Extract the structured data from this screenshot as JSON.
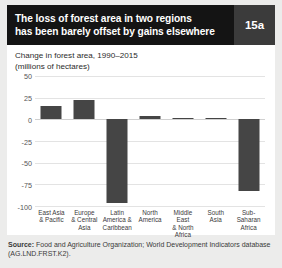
{
  "header": {
    "title_line1": "The loss of forest area in two regions",
    "title_line2": "has been barely offset by gains elsewhere",
    "badge": "15a"
  },
  "source": {
    "label": "Source:",
    "text": " Food and Agriculture Organization; World Development Indicators database (AG.LND.FRST.K2)."
  },
  "colors": {
    "header_bg": "#141414",
    "badge_bg": "#3b3b3b",
    "bar": "#454545",
    "panel_bg": "#ffffff",
    "page_bg": "#ececeb",
    "gridline": "#e3e3e3"
  },
  "chart_data": {
    "type": "bar",
    "title": "Change in forest area, 1990–2015",
    "subtitle": "(millions of hectares)",
    "xlabel": "",
    "ylabel": "",
    "ylim": [
      -100,
      50
    ],
    "yticks": [
      50,
      25,
      0,
      -25,
      -50,
      -75,
      -100
    ],
    "ytick_labels": [
      "50",
      "25",
      "0",
      "-25",
      "-50",
      "-75",
      "-100"
    ],
    "grid": true,
    "legend": "none",
    "categories": [
      "East Asia & Pacific",
      "Europe & Central Asia",
      "Latin America & Caribbean",
      "North America",
      "Middle East & North Africa",
      "South Asia",
      "Sub-Saharan Africa"
    ],
    "category_lines": [
      [
        "East Asia",
        "& Pacific"
      ],
      [
        "Europe",
        "& Central",
        "Asia"
      ],
      [
        "Latin",
        "America &",
        "Caribbean"
      ],
      [
        "North",
        "America"
      ],
      [
        "Middle East",
        "& North",
        "Africa"
      ],
      [
        "South",
        "Asia"
      ],
      [
        "Sub-Saharan",
        "Africa"
      ]
    ],
    "values": [
      15,
      22,
      -97,
      4,
      1,
      2,
      -83
    ]
  }
}
